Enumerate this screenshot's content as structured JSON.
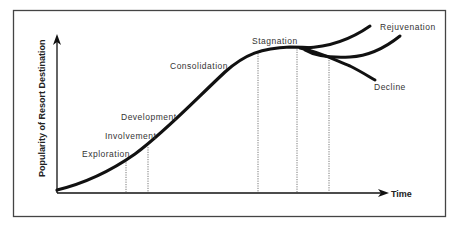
{
  "diagram": {
    "y_axis_label": "Popularity of Resort Destination",
    "x_axis_label": "Time",
    "stages": [
      {
        "label": "Exploration",
        "x": 82,
        "y": 157
      },
      {
        "label": "Involvement",
        "x": 105,
        "y": 139
      },
      {
        "label": "Development",
        "x": 121,
        "y": 120
      },
      {
        "label": "Consolidation",
        "x": 170,
        "y": 69
      },
      {
        "label": "Stagnation",
        "x": 252,
        "y": 44
      },
      {
        "label": "Rejuvenation",
        "x": 380,
        "y": 30
      },
      {
        "label": "Decline",
        "x": 374,
        "y": 90
      }
    ],
    "colors": {
      "curve": "#111111",
      "axis": "#111111",
      "border": "#444444",
      "dotted": "#555555",
      "text": "#333333"
    }
  }
}
